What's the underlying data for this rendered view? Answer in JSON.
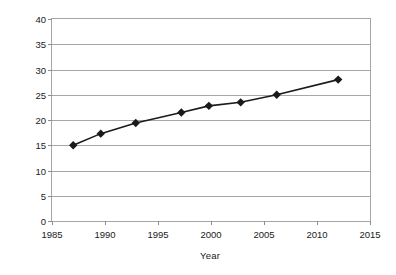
{
  "chart_data": {
    "type": "line",
    "title": "",
    "xlabel": "Year",
    "ylabel": "Percent Minority",
    "xlim": [
      1985,
      2015
    ],
    "ylim": [
      0,
      40
    ],
    "xticks": [
      1985,
      1990,
      1995,
      2000,
      2005,
      2010,
      2015
    ],
    "xtick_labels": [
      "1985",
      "1990",
      "1995",
      "2000",
      "2005",
      "2010",
      "2015"
    ],
    "yticks": [
      0,
      5,
      10,
      15,
      20,
      25,
      30,
      35,
      40
    ],
    "ytick_labels": [
      "0",
      "5",
      "10",
      "15",
      "20",
      "25",
      "30",
      "35",
      "40"
    ],
    "grid": "horizontal",
    "legend": "none",
    "marker": "diamond",
    "line_color": "#1a1a1a",
    "marker_color": "#1a1a1a",
    "grid_color": "#a6a6a6",
    "x": [
      1987.0,
      1989.6,
      1992.9,
      1997.2,
      1999.8,
      2002.8,
      2006.2,
      2012.0
    ],
    "y": [
      15.0,
      17.3,
      19.4,
      21.5,
      22.8,
      23.5,
      25.0,
      28.0
    ],
    "points": [
      {
        "x": 1987.0,
        "y": 15.0
      },
      {
        "x": 1989.6,
        "y": 17.3
      },
      {
        "x": 1992.9,
        "y": 19.4
      },
      {
        "x": 1997.2,
        "y": 21.5
      },
      {
        "x": 1999.8,
        "y": 22.8
      },
      {
        "x": 2002.8,
        "y": 23.5
      },
      {
        "x": 2006.2,
        "y": 25.0
      },
      {
        "x": 2012.0,
        "y": 28.0
      }
    ]
  }
}
